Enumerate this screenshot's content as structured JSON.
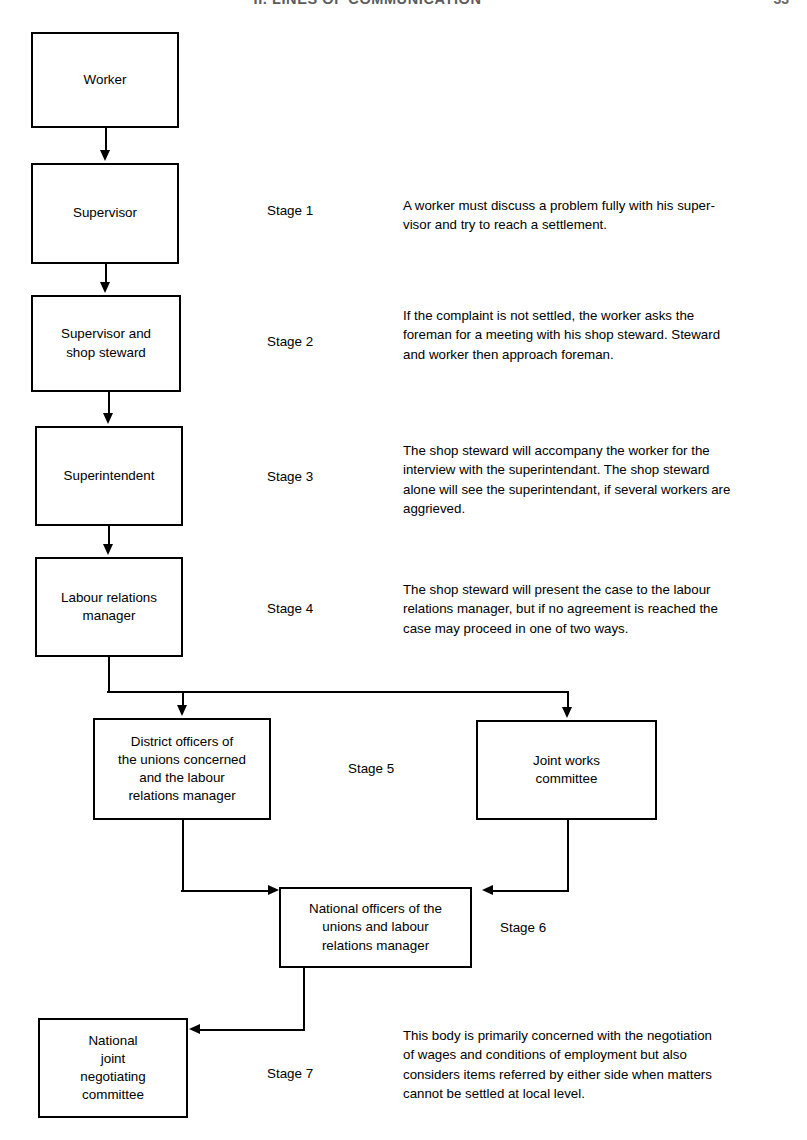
{
  "header": {
    "title": "II. LINES OF COMMUNICATION",
    "page_number": "33"
  },
  "diagram": {
    "nodes": [
      {
        "id": "worker",
        "label": "Worker"
      },
      {
        "id": "supervisor",
        "label": "Supervisor"
      },
      {
        "id": "supervisor-steward",
        "label": "Supervisor and\nshop steward"
      },
      {
        "id": "superintendent",
        "label": "Superintendent"
      },
      {
        "id": "labour-relations-manager",
        "label": "Labour relations\nmanager"
      },
      {
        "id": "district-officers",
        "label": "District officers of\nthe unions concerned\nand the labour\nrelations manager"
      },
      {
        "id": "joint-works-committee",
        "label": "Joint works\ncommittee"
      },
      {
        "id": "national-officers",
        "label": "National officers of the\nunions and labour\nrelations manager"
      },
      {
        "id": "national-joint-committee",
        "label": "National\njoint\nnegotiating\ncommittee"
      }
    ],
    "stages": [
      {
        "id": "stage-1",
        "label": "Stage 1",
        "description": "A worker must discuss a problem fully with his super-\nvisor and try to reach a settlement."
      },
      {
        "id": "stage-2",
        "label": "Stage 2",
        "description": "If the complaint is not settled, the worker asks the\nforeman for a meeting with his shop steward. Steward\nand worker then approach foreman."
      },
      {
        "id": "stage-3",
        "label": "Stage 3",
        "description": "The shop steward will accompany the worker for the\ninterview with the superintendant. The shop steward\nalone will see the superintendant, if several workers are\naggrieved."
      },
      {
        "id": "stage-4",
        "label": "Stage 4",
        "description": "The shop steward will present the case to the labour\nrelations manager, but if no agreement is reached the\ncase may proceed in one of two ways."
      },
      {
        "id": "stage-5",
        "label": "Stage 5",
        "description": ""
      },
      {
        "id": "stage-6",
        "label": "Stage 6",
        "description": ""
      },
      {
        "id": "stage-7",
        "label": "Stage 7",
        "description": "This body is primarily concerned with the negotiation\nof wages and conditions of employment but also\nconsiders items referred by either side when matters\ncannot be settled at local level."
      }
    ],
    "colors": {
      "line": "#000000",
      "box_fill": "#ffffff",
      "text": "#000000",
      "page_background": "#ffffff"
    }
  }
}
